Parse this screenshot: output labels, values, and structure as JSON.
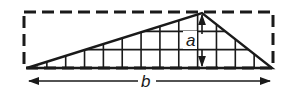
{
  "diagram": {
    "height_label": "a",
    "base_label": "b",
    "stroke_color": "#1a1a1a",
    "background_color": "#ffffff",
    "grid_columns": 13,
    "grid_rows": 3,
    "apex_position_fraction_of_base": 0.7
  }
}
